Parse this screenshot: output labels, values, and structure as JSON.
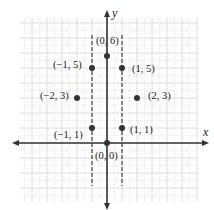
{
  "diagram": {
    "type": "coordinate-plane",
    "axes": {
      "x_label": "x",
      "y_label": "y"
    },
    "grid": {
      "x_range": [
        -7,
        6
      ],
      "y_range": [
        -4,
        8
      ],
      "unit_px": 15
    },
    "dashed_lines": [
      {
        "x": -1,
        "y_from": 7,
        "y_to": -3
      },
      {
        "x": 1,
        "y_from": 7,
        "y_to": -3
      }
    ],
    "points": [
      {
        "x": 0,
        "y": 6,
        "label": "(0, 6)"
      },
      {
        "x": -1,
        "y": 5,
        "label": "(−1, 5)"
      },
      {
        "x": 1,
        "y": 5,
        "label": "(1, 5)"
      },
      {
        "x": -2,
        "y": 3,
        "label": "(−2, 3)"
      },
      {
        "x": 2,
        "y": 3,
        "label": "(2, 3)"
      },
      {
        "x": -1,
        "y": 1,
        "label": "(−1, 1)"
      },
      {
        "x": 1,
        "y": 1,
        "label": "(1, 1)"
      },
      {
        "x": 0,
        "y": 0,
        "label": "(0, 0)"
      }
    ],
    "colors": {
      "axis": "#333333",
      "grid": "#c8c8c8",
      "point": "#333333"
    }
  }
}
